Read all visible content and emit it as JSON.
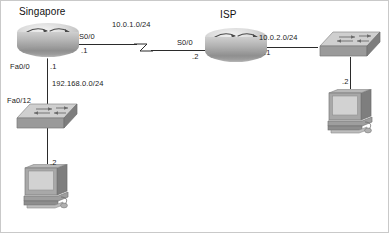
{
  "diagram": {
    "background_color": "#ffffff",
    "line_color": "#2b2b2b",
    "text_color": "#1a1a1a"
  },
  "nodes": {
    "singapore_router": {
      "label": "Singapore",
      "icon": "router-icon",
      "interfaces": {
        "serial": {
          "name": "S0/0",
          "address": ".1"
        },
        "fastethernet": {
          "name": "Fa0/0",
          "address": ".1"
        }
      }
    },
    "isp_router": {
      "label": "ISP",
      "icon": "router-icon",
      "interfaces": {
        "serial": {
          "name": "S0/0",
          "address": ".2"
        },
        "fastethernet": {
          "name": "",
          "address": ".1"
        }
      }
    },
    "left_switch": {
      "label": "",
      "icon": "switch-icon",
      "interfaces": {
        "port": {
          "name": "Fa0/12",
          "address": ""
        }
      }
    },
    "right_switch": {
      "label": "",
      "icon": "switch-icon",
      "interfaces": {
        "port": {
          "name": "",
          "address": ""
        }
      }
    },
    "left_pc": {
      "label": "",
      "icon": "pc-icon",
      "address": ".2"
    },
    "right_pc": {
      "label": "",
      "icon": "pc-icon",
      "address": ".2"
    }
  },
  "networks": {
    "serial_wan": {
      "label": "10.0.1.0/24",
      "link_type": "serial"
    },
    "isp_lan": {
      "label": "10.0.2.0/24",
      "link_type": "ethernet"
    },
    "singapore_lan": {
      "label": "192.168.0.0/24",
      "link_type": "ethernet"
    }
  }
}
